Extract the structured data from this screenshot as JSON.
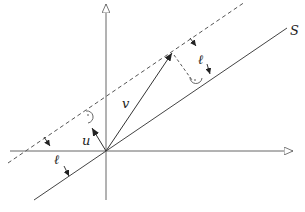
{
  "diagram": {
    "labels": {
      "line_s": "S",
      "vector_v": "v",
      "vector_u": "u",
      "distance_top": "ℓ",
      "distance_bottom": "ℓ"
    },
    "colors": {
      "stroke": "#333333",
      "axis": "#555555",
      "background": "#ffffff"
    }
  }
}
